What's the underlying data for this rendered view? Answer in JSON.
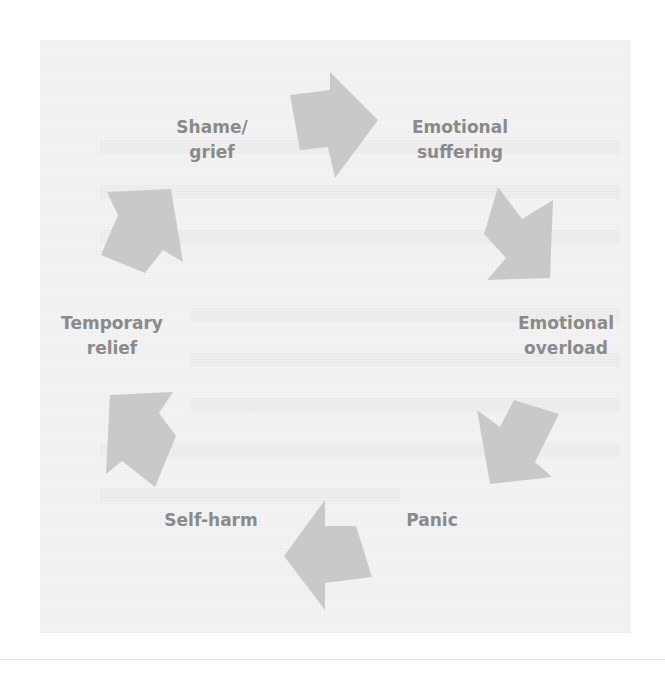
{
  "diagram": {
    "type": "cycle",
    "colors": {
      "panel_bg": "#f3f3f3",
      "arrow_fill": "#c9c9c9",
      "label_text": "#8a8a8a"
    },
    "nodes": [
      {
        "id": "shame",
        "lines": [
          "Shame/",
          "grief"
        ],
        "x": 212,
        "y": 140
      },
      {
        "id": "emotional-suffering",
        "lines": [
          "Emotional",
          "suffering"
        ],
        "x": 460,
        "y": 140
      },
      {
        "id": "emotional-overload",
        "lines": [
          "Emotional",
          "overload"
        ],
        "x": 566,
        "y": 336
      },
      {
        "id": "panic",
        "lines": [
          "Panic"
        ],
        "x": 432,
        "y": 520
      },
      {
        "id": "self-harm",
        "lines": [
          "Self-harm"
        ],
        "x": 211,
        "y": 520
      },
      {
        "id": "temporary-relief",
        "lines": [
          "Temporary",
          "relief"
        ],
        "x": 112,
        "y": 336
      }
    ],
    "edges": [
      {
        "from": "shame",
        "to": "emotional-suffering",
        "direction": "right"
      },
      {
        "from": "emotional-suffering",
        "to": "emotional-overload",
        "direction": "down-right"
      },
      {
        "from": "emotional-overload",
        "to": "panic",
        "direction": "down-left"
      },
      {
        "from": "panic",
        "to": "self-harm",
        "direction": "left"
      },
      {
        "from": "self-harm",
        "to": "temporary-relief",
        "direction": "up-left"
      },
      {
        "from": "temporary-relief",
        "to": "shame",
        "direction": "up-right"
      }
    ]
  }
}
